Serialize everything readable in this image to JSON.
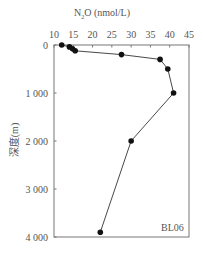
{
  "chart_data": {
    "type": "line",
    "title": "N2O (nmol/L)",
    "title_parts": {
      "prefix": "N",
      "subscript": "2",
      "suffix": "O (nmol/L)"
    },
    "xlabel": "N2O (nmol/L)",
    "ylabel": "深度(m)",
    "x_axis_position": "top",
    "y_axis_inverted": true,
    "xlim": [
      10,
      45
    ],
    "ylim": [
      0,
      4000
    ],
    "x_ticks": [
      "10",
      "15",
      "20",
      "25",
      "30",
      "35",
      "40",
      "45"
    ],
    "y_ticks": [
      "0",
      "1 000",
      "2 000",
      "3 000",
      "4 000"
    ],
    "grid": false,
    "annotation": "BL06",
    "series": [
      {
        "name": "BL06",
        "marker": "circle",
        "color": "#111111",
        "points": [
          {
            "x": 12.0,
            "depth": 0
          },
          {
            "x": 14.0,
            "depth": 40
          },
          {
            "x": 14.8,
            "depth": 80
          },
          {
            "x": 15.5,
            "depth": 120
          },
          {
            "x": 27.5,
            "depth": 200
          },
          {
            "x": 37.5,
            "depth": 300
          },
          {
            "x": 39.5,
            "depth": 500
          },
          {
            "x": 41.0,
            "depth": 1000
          },
          {
            "x": 30.0,
            "depth": 2000
          },
          {
            "x": 22.0,
            "depth": 3900
          }
        ]
      }
    ]
  },
  "labels": {
    "title_prefix": "N",
    "title_sub": "2",
    "title_suffix": "O (nmol/L)",
    "ylabel": "深度(m)",
    "station": "BL06"
  }
}
